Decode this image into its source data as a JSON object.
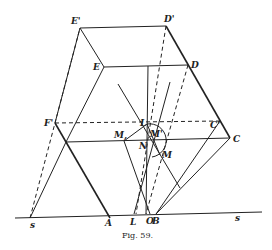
{
  "figure": {
    "caption": "Fig. 59.",
    "labels": {
      "E_prime": "E'",
      "D_prime": "D'",
      "E": "E",
      "D": "D",
      "F_prime": "F'",
      "C_prime": "C'",
      "C": "C",
      "L": "L",
      "M_sub": "M,",
      "M_prime": "M'",
      "N": "N",
      "M": "M",
      "s_left": "s",
      "A": "A",
      "L_base": "L",
      "O": "O",
      "B": "B",
      "s_right": "s"
    }
  }
}
